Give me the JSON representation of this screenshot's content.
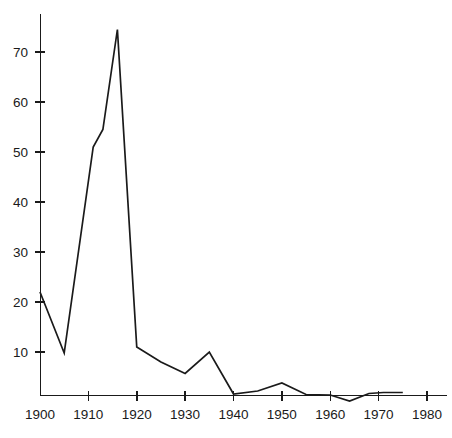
{
  "chart_data": {
    "type": "line",
    "title": "",
    "subtitle": "",
    "xlabel": "",
    "ylabel": "",
    "xlim": [
      1900,
      1980
    ],
    "ylim": [
      0,
      78
    ],
    "grid": false,
    "legend": null,
    "legend_position": "none",
    "line_color": "#1a1a1a",
    "axis_color": "#1a1a1a",
    "background_color": "#ffffff",
    "x_ticks": [
      1900,
      1910,
      1920,
      1930,
      1940,
      1950,
      1960,
      1970,
      1980
    ],
    "x_tick_labels": [
      "1900",
      "1910",
      "1920",
      "1930",
      "1940",
      "1950",
      "1960",
      "1970",
      "1980"
    ],
    "y_ticks": [
      10,
      20,
      30,
      40,
      50,
      60,
      70
    ],
    "y_tick_labels": [
      "10",
      "20",
      "30",
      "40",
      "50",
      "60",
      "70"
    ],
    "x": [
      1900,
      1905,
      1911,
      1913,
      1916,
      1920,
      1925,
      1930,
      1935,
      1940,
      1945,
      1950,
      1955,
      1960,
      1964,
      1968,
      1971,
      1975
    ],
    "values": [
      22.0,
      9.8,
      51.0,
      54.5,
      74.5,
      11.0,
      8.0,
      5.7,
      10.0,
      1.6,
      2.2,
      3.8,
      1.5,
      1.4,
      0.2,
      1.7,
      1.9,
      1.9
    ],
    "series": [
      {
        "name": "series-1",
        "values": [
          22.0,
          9.8,
          51.0,
          54.5,
          74.5,
          11.0,
          8.0,
          5.7,
          10.0,
          1.6,
          2.2,
          3.8,
          1.5,
          1.4,
          0.2,
          1.7,
          1.9,
          1.9
        ]
      }
    ],
    "annotations": []
  },
  "figure": {
    "title_remnant": ""
  }
}
